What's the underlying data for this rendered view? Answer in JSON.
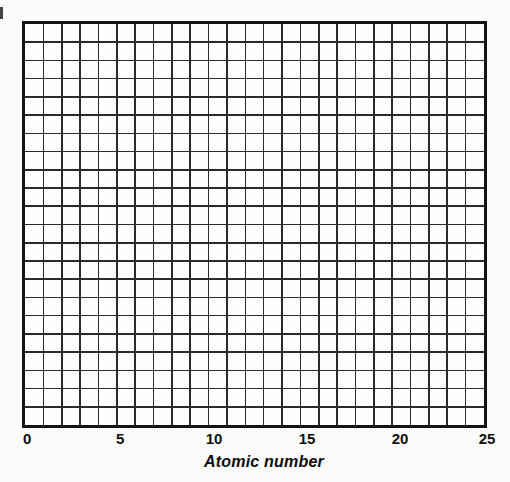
{
  "figure": {
    "title": "",
    "background_color": "#fbfbfa"
  },
  "chart_data": {
    "type": "line",
    "title": "",
    "subtitle": "",
    "xlabel": "Atomic number",
    "ylabel": "",
    "xlim": [
      0,
      25
    ],
    "ylim": [
      0,
      22
    ],
    "grid": true,
    "legend": null,
    "series": [],
    "categories": [],
    "values": [],
    "annotations": [],
    "note": "Blank graph paper: no data plotted",
    "x_ticks": [
      {
        "value": 0,
        "label": "0"
      },
      {
        "value": 5,
        "label": "5"
      },
      {
        "value": 10,
        "label": "10"
      },
      {
        "value": 15,
        "label": "15"
      },
      {
        "value": 20,
        "label": "20"
      },
      {
        "value": 25,
        "label": "25"
      }
    ],
    "y_ticks": [],
    "grid_columns": 25,
    "grid_rows": 22,
    "grid_line_color": "#2b2b2b",
    "border_color": "#141414",
    "plot_background": "#fdfdfc"
  },
  "axis": {
    "x_title": "Atomic number",
    "ticks": [
      "0",
      "5",
      "10",
      "15",
      "20",
      "25"
    ]
  }
}
